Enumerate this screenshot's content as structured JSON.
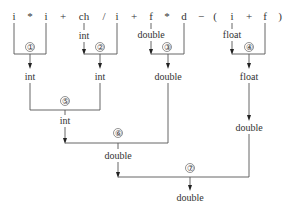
{
  "expression": {
    "tokens": [
      {
        "text": "i",
        "x": 14
      },
      {
        "text": "*",
        "x": 30
      },
      {
        "text": "i",
        "x": 46
      },
      {
        "text": "+",
        "x": 63
      },
      {
        "text": "ch",
        "x": 84
      },
      {
        "text": "/",
        "x": 104
      },
      {
        "text": "i",
        "x": 117
      },
      {
        "text": "+",
        "x": 134
      },
      {
        "text": "f",
        "x": 151
      },
      {
        "text": "*",
        "x": 167
      },
      {
        "text": "d",
        "x": 184
      },
      {
        "text": "−",
        "x": 201
      },
      {
        "text": "(",
        "x": 215
      },
      {
        "text": "i",
        "x": 232
      },
      {
        "text": "+",
        "x": 249
      },
      {
        "text": "f",
        "x": 265
      },
      {
        "text": ")",
        "x": 280
      }
    ]
  },
  "conversions": {
    "ch_to": "int",
    "f_to": "double",
    "i_to": "float"
  },
  "steps": [
    {
      "id": "step-1",
      "marker": "①",
      "result": "int"
    },
    {
      "id": "step-2",
      "marker": "②",
      "result": "int"
    },
    {
      "id": "step-3",
      "marker": "③",
      "result": "double"
    },
    {
      "id": "step-4",
      "marker": "④",
      "result": "float"
    },
    {
      "id": "step-5",
      "marker": "⑤",
      "result": "int"
    },
    {
      "id": "step-6",
      "marker": "⑥",
      "result": "double"
    },
    {
      "id": "step-7",
      "marker": "⑦",
      "result": "double"
    }
  ],
  "float_promotion": "double"
}
